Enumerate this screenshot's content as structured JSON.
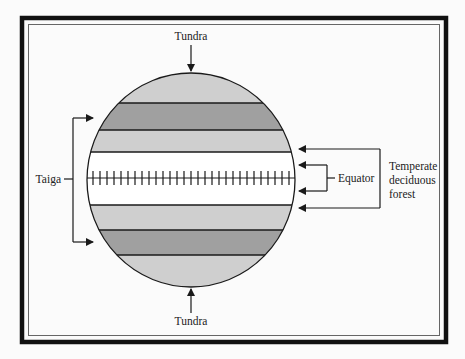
{
  "diagram": {
    "type": "biome-globe",
    "labels": {
      "tundra_top": "Tundra",
      "tundra_bottom": "Tundra",
      "taiga": "Taiga",
      "equator": "Equator",
      "temperate_line1": "Temperate",
      "temperate_line2": "deciduous",
      "temperate_line3": "forest"
    },
    "bands": [
      {
        "name": "tundra-north",
        "color": "#cfcfcf"
      },
      {
        "name": "taiga-north",
        "color": "#a0a0a0"
      },
      {
        "name": "temperate-north",
        "color": "#cfcfcf"
      },
      {
        "name": "equatorial",
        "color": "#ffffff"
      },
      {
        "name": "temperate-south",
        "color": "#cfcfcf"
      },
      {
        "name": "taiga-south",
        "color": "#a0a0a0"
      },
      {
        "name": "tundra-south",
        "color": "#cfcfcf"
      }
    ],
    "colors": {
      "frame": "#111111",
      "line": "#1a1a1a",
      "background": "#fbfbfb"
    }
  }
}
